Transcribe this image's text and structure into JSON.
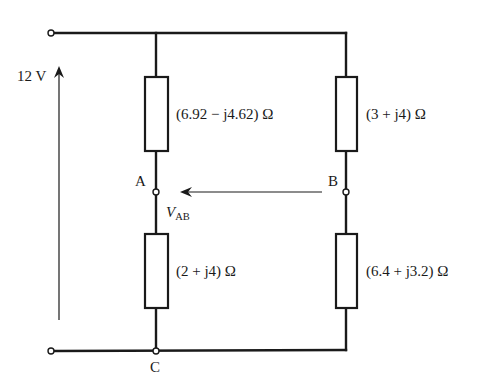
{
  "diagram": {
    "type": "ac-bridge-circuit",
    "source": {
      "label": "12 V",
      "arrow_direction": "up"
    },
    "impedances": {
      "top_left": "(6.92 − j4.62) Ω",
      "bottom_left": "(2 + j4) Ω",
      "top_right": "(3 + j4) Ω",
      "bottom_right": "(6.4 + j3.2) Ω"
    },
    "nodes": {
      "a": "A",
      "b": "B",
      "c": "C"
    },
    "voltage_measure": {
      "symbol": "V",
      "subscript": "AB",
      "arrow_direction": "from B to A"
    },
    "colors": {
      "line": "#1a1a1a",
      "background": "#ffffff"
    }
  }
}
